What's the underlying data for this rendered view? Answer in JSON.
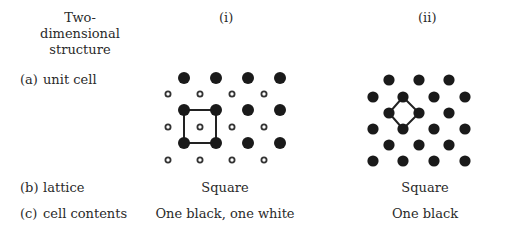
{
  "header": {
    "structure_label": [
      "Two-",
      "dimensional",
      "structure"
    ],
    "col_i": "(i)",
    "col_ii": "(ii)"
  },
  "rows": {
    "a": {
      "marker": "(a)",
      "label": "unit cell"
    },
    "b": {
      "marker": "(b)",
      "label": "lattice",
      "i": "Square",
      "ii": "Square"
    },
    "c": {
      "marker": "(c)",
      "label": "cell contents",
      "i": "One black, one white",
      "ii": "One black"
    }
  },
  "colors": {
    "black_atom": "#1a1a1a",
    "white_atom_ring": "#333333",
    "cell_line": "#222222"
  },
  "structures": {
    "i": {
      "black_atoms": 12,
      "white_atoms": 12,
      "unit_cell": "square through four black atoms"
    },
    "ii": {
      "black_atoms": 21,
      "unit_cell": "diamond (rotated square) through four black atoms"
    }
  }
}
